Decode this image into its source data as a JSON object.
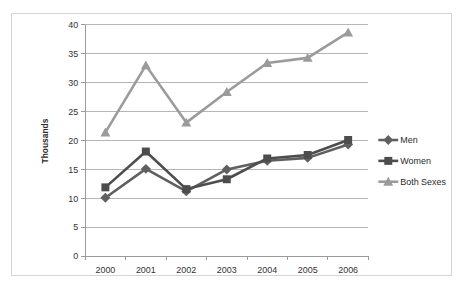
{
  "chart_data": {
    "type": "line",
    "title": "",
    "xlabel": "",
    "ylabel": "Thousands",
    "categories": [
      "2000",
      "2001",
      "2002",
      "2003",
      "2004",
      "2005",
      "2006"
    ],
    "ylim": [
      0,
      40
    ],
    "ytick_step": 5,
    "yticks": [
      "0",
      "5",
      "10",
      "15",
      "20",
      "25",
      "30",
      "35",
      "40"
    ],
    "grid": "horizontal",
    "legend_position": "right",
    "series": [
      {
        "name": "Men",
        "marker": "diamond",
        "color": "#606060",
        "values": [
          10.1,
          15.1,
          11.2,
          15.0,
          16.5,
          17.0,
          19.3
        ]
      },
      {
        "name": "Women",
        "marker": "square",
        "color": "#4d4d4d",
        "values": [
          11.9,
          18.1,
          11.6,
          13.3,
          16.9,
          17.5,
          20.1
        ]
      },
      {
        "name": "Both Sexes",
        "marker": "triangle",
        "color": "#9b9b9b",
        "values": [
          21.4,
          33.0,
          23.1,
          28.4,
          33.4,
          34.3,
          38.7
        ]
      }
    ]
  },
  "figure": {
    "border_color": "#d5d5d5",
    "background": "#ffffff",
    "grid_color": "#b4b4b4",
    "axis_color": "#9a9a9a"
  }
}
